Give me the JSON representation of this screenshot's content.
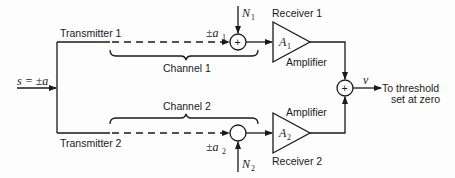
{
  "diagram": {
    "input": {
      "label": "s = ±a"
    },
    "transmitters": [
      {
        "label": "Transmitter 1"
      },
      {
        "label": "Transmitter 2"
      }
    ],
    "channels": [
      {
        "label": "Channel 1",
        "signal": "±a",
        "signal_sub": "1",
        "noise": "N",
        "noise_sub": "1",
        "summer_symbol": "+"
      },
      {
        "label": "Channel 2",
        "signal": "±a",
        "signal_sub": "2",
        "noise": "N",
        "noise_sub": "2",
        "summer_symbol": ""
      }
    ],
    "receivers": [
      {
        "label": "Receiver 1",
        "amplifier_label": "Amplifier",
        "gain": "A",
        "gain_sub": "1"
      },
      {
        "label": "Receiver 2",
        "amplifier_label": "Amplifier",
        "gain": "A",
        "gain_sub": "2"
      }
    ],
    "combiner": {
      "symbol": "+"
    },
    "output": {
      "variable": "v",
      "label_line1": "To threshold",
      "label_line2": "set at zero"
    }
  }
}
